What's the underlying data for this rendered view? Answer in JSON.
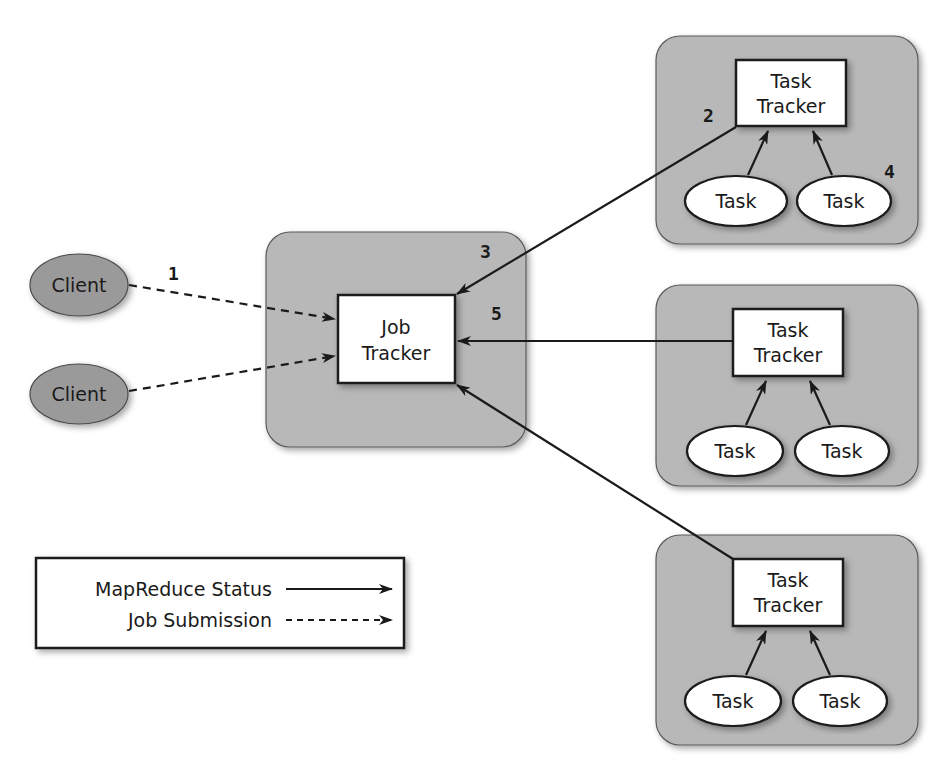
{
  "diagram": {
    "colors": {
      "node_fill": "#b8b8b8",
      "node_stroke": "#4a4a4a",
      "box_fill": "#ffffff",
      "line": "#1a1a1a",
      "client_fill": "#9a9a9a"
    },
    "clients": [
      {
        "label": "Client"
      },
      {
        "label": "Client"
      }
    ],
    "job_tracker": {
      "line1": "Job",
      "line2": "Tracker"
    },
    "task_nodes": [
      {
        "tracker_line1": "Task",
        "tracker_line2": "Tracker",
        "tasks": [
          "Task",
          "Task"
        ]
      },
      {
        "tracker_line1": "Task",
        "tracker_line2": "Tracker",
        "tasks": [
          "Task",
          "Task"
        ]
      },
      {
        "tracker_line1": "Task",
        "tracker_line2": "Tracker",
        "tasks": [
          "Task",
          "Task"
        ]
      }
    ],
    "step_labels": {
      "s1": "1",
      "s2": "2",
      "s3": "3",
      "s4": "4",
      "s5": "5"
    },
    "legend": {
      "status_label": "MapReduce Status",
      "submission_label": "Job Submission"
    }
  }
}
